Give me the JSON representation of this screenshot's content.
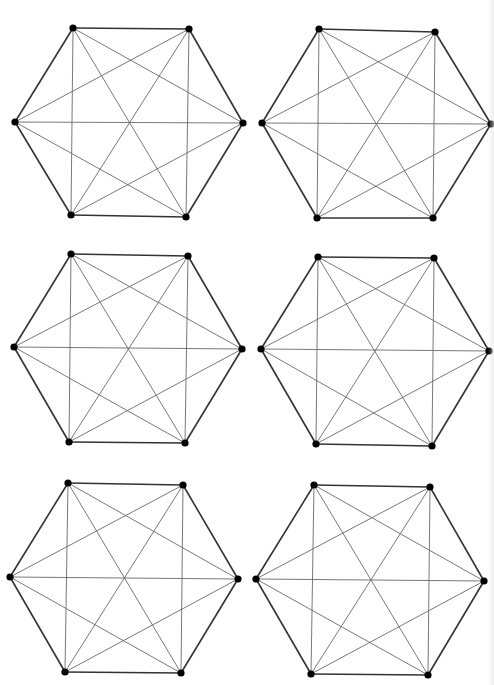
{
  "diagram": {
    "graph_type": "K6",
    "vertex_count": 6,
    "edge_count": 15,
    "colors": {
      "background": "#ffffff",
      "vertex": "#000000",
      "perimeter_edge": "#333333",
      "diagonal_edge": "#6a6a6a"
    },
    "style": {
      "vertex_radius": 3.6,
      "perimeter_width": 1.6,
      "diagonal_width": 0.9
    },
    "panels": [
      {
        "id": "panel-1",
        "vertices": [
          [
            73,
            28
          ],
          [
            189,
            29
          ],
          [
            243,
            123
          ],
          [
            186,
            217
          ],
          [
            71,
            215
          ],
          [
            15,
            122
          ]
        ]
      },
      {
        "id": "panel-2",
        "vertices": [
          [
            319,
            29
          ],
          [
            435,
            32
          ],
          [
            491,
            124
          ],
          [
            433,
            218
          ],
          [
            317,
            218
          ],
          [
            262,
            123
          ]
        ]
      },
      {
        "id": "panel-3",
        "vertices": [
          [
            71,
            254
          ],
          [
            188,
            256
          ],
          [
            242,
            349
          ],
          [
            185,
            443
          ],
          [
            69,
            442
          ],
          [
            14,
            347
          ]
        ]
      },
      {
        "id": "panel-4",
        "vertices": [
          [
            318,
            257
          ],
          [
            434,
            258
          ],
          [
            489,
            351
          ],
          [
            432,
            446
          ],
          [
            316,
            444
          ],
          [
            261,
            349
          ]
        ]
      },
      {
        "id": "panel-5",
        "vertices": [
          [
            68,
            483
          ],
          [
            183,
            485
          ],
          [
            238,
            579
          ],
          [
            181,
            673
          ],
          [
            65,
            672
          ],
          [
            10,
            577
          ]
        ]
      },
      {
        "id": "panel-6",
        "vertices": [
          [
            314,
            485
          ],
          [
            430,
            487
          ],
          [
            484,
            581
          ],
          [
            428,
            675
          ],
          [
            311,
            674
          ],
          [
            256,
            579
          ]
        ]
      }
    ]
  }
}
